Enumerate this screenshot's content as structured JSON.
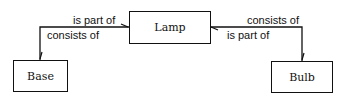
{
  "diagram": {
    "type": "entity-relationship",
    "nodes": [
      {
        "id": "lamp",
        "label": "Lamp"
      },
      {
        "id": "base",
        "label": "Base"
      },
      {
        "id": "bulb",
        "label": "Bulb"
      }
    ],
    "edges": [
      {
        "from": "base",
        "to": "lamp",
        "label_forward": "is part of",
        "label_reverse": "consists of"
      },
      {
        "from": "bulb",
        "to": "lamp",
        "label_forward": "is part of",
        "label_reverse": "consists of"
      }
    ],
    "edge_labels": {
      "left_top": "is part of",
      "left_bottom": "consists of",
      "right_top": "consists of",
      "right_bottom": "is part of"
    }
  }
}
